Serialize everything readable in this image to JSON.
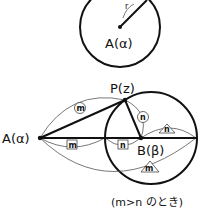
{
  "figure1": {
    "center_label": "A(α)",
    "radius_label": "r"
  },
  "figure2": {
    "point_p_label": "P(z)",
    "point_a_label": "A(α)",
    "point_b_label": "B(β)",
    "marks": {
      "ap_circle": "m",
      "pb_circle": "n",
      "b_right_triangle": "n",
      "ab_square_m": "m",
      "ab_square_n": "n",
      "bottom_triangle": "m"
    },
    "caption": "(m>n のとき)"
  }
}
